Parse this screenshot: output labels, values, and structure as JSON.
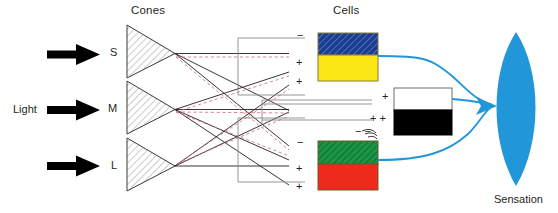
{
  "diagram": {
    "title_cones": "Cones",
    "title_cells": "Cells",
    "light_label": "Light",
    "sensation_label": "Sensation",
    "cone_labels": [
      "S",
      "M",
      "L"
    ],
    "signs": [
      {
        "id": "blue-minus",
        "text": "−"
      },
      {
        "id": "yellow-plus-upper",
        "text": "+"
      },
      {
        "id": "yellow-plus-lower",
        "text": "+"
      },
      {
        "id": "white-plus",
        "text": "+"
      },
      {
        "id": "black-plus-pair",
        "text": "+ +"
      },
      {
        "id": "black-minus-pair",
        "text": "−  −"
      },
      {
        "id": "green-minus",
        "text": "−"
      },
      {
        "id": "red-plus-upper",
        "text": "+"
      },
      {
        "id": "red-plus-lower",
        "text": "+"
      }
    ],
    "cells": [
      {
        "name": "blue-yellow-cell",
        "top": "blue",
        "bottom": "yellow"
      },
      {
        "name": "white-black-cell",
        "top": "white",
        "bottom": "black"
      },
      {
        "name": "green-red-cell",
        "top": "green",
        "bottom": "red"
      }
    ],
    "colors": {
      "blue_top": "#1b3d8f",
      "blue_hatch": "#5a7fc4",
      "yellow": "#fbe715",
      "white": "#ffffff",
      "black": "#000000",
      "green": "#1a9445",
      "green_hatch": "#0d6b2e",
      "red": "#ee2a1c",
      "sensation_blue": "#2196d8",
      "line_black": "#231f20",
      "line_red_dashed": "#d96a7a",
      "arrow_black": "#000000"
    }
  }
}
